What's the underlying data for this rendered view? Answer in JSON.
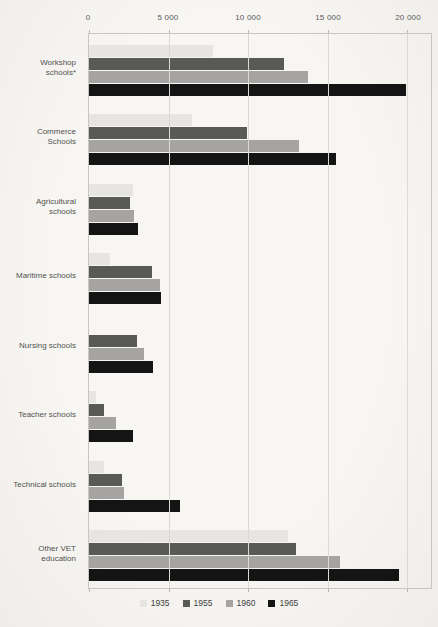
{
  "chart_data": {
    "type": "bar",
    "orientation": "horizontal",
    "title": "",
    "xlabel": "",
    "ylabel": "",
    "categories": [
      "Workshop schools*",
      "Commerce Schools",
      "Agricultural schools",
      "Maritime schools",
      "Nursing schools",
      "Teacher schools",
      "Technical schools",
      "Other VET education"
    ],
    "category_label_lines": [
      [
        "Workshop",
        "schools*"
      ],
      [
        "Commerce",
        "Schools"
      ],
      [
        "Agricultural",
        "schools"
      ],
      [
        "Maritime schools"
      ],
      [
        "Nursing schools"
      ],
      [
        "Teacher schools"
      ],
      [
        "Technical schools"
      ],
      [
        "Other VET",
        "education"
      ]
    ],
    "series": [
      {
        "name": "1935",
        "color": "#e6e5e2",
        "values": [
          7800,
          6450,
          2750,
          1300,
          0,
          450,
          950,
          12500
        ]
      },
      {
        "name": "1955",
        "color": "#595957",
        "values": [
          12250,
          9950,
          2550,
          3950,
          3000,
          950,
          2100,
          13000
        ]
      },
      {
        "name": "1960",
        "color": "#a5a4a2",
        "values": [
          13750,
          13200,
          2850,
          4450,
          3450,
          1700,
          2200,
          15800
        ]
      },
      {
        "name": "1965",
        "color": "#141414",
        "values": [
          19900,
          15500,
          3050,
          4550,
          4050,
          2750,
          5700,
          19500
        ]
      }
    ],
    "ticks": [
      0,
      5000,
      10000,
      15000,
      20000
    ],
    "tick_labels": [
      "0",
      "5 000",
      "10 000",
      "15 000",
      "20 000"
    ],
    "xlim": [
      0,
      21500
    ],
    "grid": "vertical",
    "legend_position": "bottom",
    "colors": {
      "grid": "#dcd9d3",
      "plot_border": "#c9c6c0",
      "axis_text": "#595957",
      "category_text": "#52524f",
      "paper": "#f6f5f2"
    }
  }
}
